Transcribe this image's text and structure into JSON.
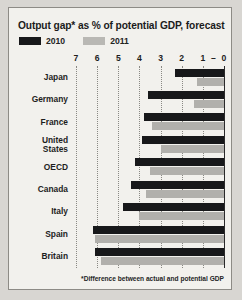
{
  "chart_data": {
    "type": "bar",
    "title": "Output gap* as % of potential GDP, forecast",
    "footnote": "*Difference between actual and potential GDP",
    "orientation": "horizontal",
    "xlabel": "",
    "ylabel": "",
    "xlim": [
      7,
      0
    ],
    "axis_reversed": true,
    "grid": true,
    "legend_position": "top-left",
    "tick_labels": [
      "7",
      "6",
      "5",
      "4",
      "3",
      "2",
      "1",
      "–",
      "0"
    ],
    "tick_values": [
      7,
      6,
      5,
      4,
      3,
      2,
      1,
      0.5,
      0
    ],
    "categories": [
      "Japan",
      "Germany",
      "France",
      "United States",
      "OECD",
      "Canada",
      "Italy",
      "Spain",
      "Britain"
    ],
    "series": [
      {
        "name": "2010",
        "color": "#17181a",
        "values": [
          2.3,
          3.6,
          3.8,
          3.9,
          4.2,
          4.4,
          4.8,
          6.2,
          6.1
        ]
      },
      {
        "name": "2011",
        "color": "#b1b0ac",
        "values": [
          1.3,
          1.4,
          3.4,
          3.0,
          3.5,
          3.7,
          4.0,
          6.1,
          5.8
        ]
      }
    ]
  },
  "legend": {
    "items": [
      {
        "label": "2010",
        "color": "#17181a"
      },
      {
        "label": "2011",
        "color": "#b1b0ac"
      }
    ]
  }
}
